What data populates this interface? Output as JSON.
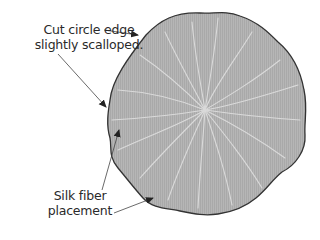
{
  "diagram": {
    "type": "illustration",
    "colors": {
      "fill": "#b4b4b4",
      "outline": "#333333",
      "fibers": "#d8d8d8",
      "arrows": "#444444",
      "text": "#2a2a2a"
    },
    "labels": {
      "edge": {
        "line1": "Cut circle edge",
        "line2": "slightly scalloped."
      },
      "fiber": {
        "line1": "Silk fiber",
        "line2": "placement"
      }
    }
  }
}
